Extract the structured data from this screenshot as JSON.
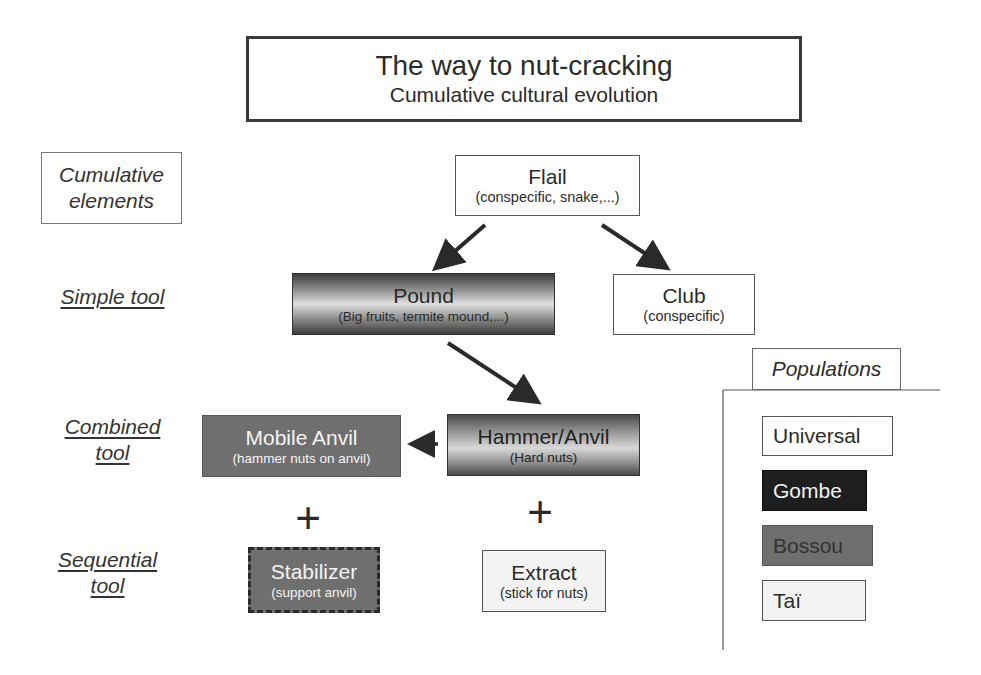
{
  "title": {
    "main": "The way to nut-cracking",
    "subtitle": "Cumulative cultural evolution"
  },
  "levels": {
    "cumulative_line1": "Cumulative",
    "cumulative_line2": "elements",
    "simple": "Simple tool",
    "combined_line1": "Combined",
    "combined_line2": "tool",
    "sequential_line1": "Sequential",
    "sequential_line2": "tool"
  },
  "nodes": {
    "flail": {
      "label": "Flail",
      "detail": "(conspecific, snake,...)",
      "population": "Universal"
    },
    "pound": {
      "label": "Pound",
      "detail": "(Big fruits, termite mound,...)",
      "population": "mixed"
    },
    "club": {
      "label": "Club",
      "detail": "(conspecific)",
      "population": "Universal"
    },
    "hammer_anvil": {
      "label": "Hammer/Anvil",
      "detail": "(Hard nuts)",
      "population": "mixed"
    },
    "mobile_anvil": {
      "label": "Mobile Anvil",
      "detail": "(hammer nuts on anvil)",
      "population": "Bossou"
    },
    "stabilizer": {
      "label": "Stabilizer",
      "detail": "(support anvil)",
      "population": "Bossou"
    },
    "extract": {
      "label": "Extract",
      "detail": "(stick for nuts)",
      "population": "Taï"
    }
  },
  "operators": {
    "plus_left": "+",
    "plus_right": "+"
  },
  "legend": {
    "title": "Populations",
    "items": [
      {
        "label": "Universal",
        "color": "#ffffff"
      },
      {
        "label": "Gombe",
        "color": "#1e1e1e"
      },
      {
        "label": "Bossou",
        "color": "#6f6f6f"
      },
      {
        "label": "Taï",
        "color": "#f3f3f3"
      }
    ]
  },
  "edges": [
    {
      "from": "Flail",
      "to": "Pound"
    },
    {
      "from": "Flail",
      "to": "Club"
    },
    {
      "from": "Pound",
      "to": "Hammer/Anvil"
    },
    {
      "from": "Hammer/Anvil",
      "to": "Mobile Anvil"
    }
  ]
}
